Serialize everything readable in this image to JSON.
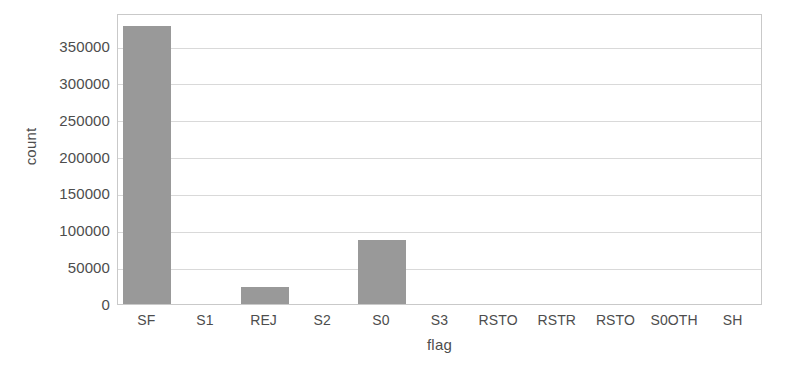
{
  "chart_data": {
    "type": "bar",
    "title": "",
    "xlabel": "flag",
    "ylabel": "count",
    "categories": [
      "SF",
      "S1",
      "REJ",
      "S2",
      "S0",
      "S3",
      "RSTO",
      "RSTR",
      "RSTO",
      "S0OTH",
      "SH"
    ],
    "values": [
      378000,
      0,
      23000,
      0,
      87000,
      0,
      0,
      0,
      0,
      0,
      0
    ],
    "ylim": [
      0,
      395000
    ],
    "yticks": [
      0,
      50000,
      100000,
      150000,
      200000,
      250000,
      300000,
      350000
    ],
    "ytick_labels": [
      "0",
      "50000",
      "100000",
      "150000",
      "200000",
      "250000",
      "300000",
      "350000"
    ],
    "grid": true,
    "legend": false,
    "bar_color": "#999999",
    "grid_color": "#d9d9d9",
    "axis_color": "#c9c9c9",
    "text_color": "#4d4d4d"
  }
}
